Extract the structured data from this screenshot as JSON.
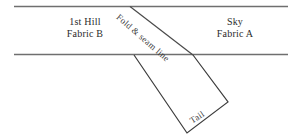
{
  "canvas": {
    "width": 301,
    "height": 138,
    "background": "#ffffff"
  },
  "style": {
    "line_color": "#6f6f6f",
    "fold_line_color": "#4a4a4a",
    "tail_line_color": "#3c3c3c",
    "text_color": "#2b2b2b",
    "rotated_text_color": "#3a3a3a",
    "line_width": 1.2
  },
  "labels": {
    "left_region": {
      "line1": "1st Hill",
      "line2": "Fabric B"
    },
    "right_region": {
      "line1": "Sky",
      "line2": "Fabric A"
    },
    "fold_seam": "Fold & seam line",
    "tail": "Tail"
  },
  "geometry": {
    "top_band_line": {
      "x1": 14,
      "y1": 6.5,
      "x2": 288,
      "y2": 6.5
    },
    "bottom_band_line": {
      "x1": 14,
      "y1": 54.5,
      "x2": 288,
      "y2": 54.5
    },
    "fold_line": {
      "x1": 130,
      "y1": 6.5,
      "x2": 193,
      "y2": 55
    },
    "tail_polyline": [
      {
        "x": 134,
        "y": 55
      },
      {
        "x": 187,
        "y": 133
      },
      {
        "x": 228,
        "y": 102
      },
      {
        "x": 193,
        "y": 55
      }
    ]
  }
}
